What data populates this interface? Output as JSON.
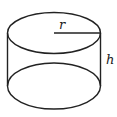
{
  "diagram": {
    "shape": "cylinder",
    "labels": {
      "radius": "r",
      "height": "h"
    },
    "colors": {
      "stroke": "#222222",
      "background": "#ffffff"
    }
  }
}
